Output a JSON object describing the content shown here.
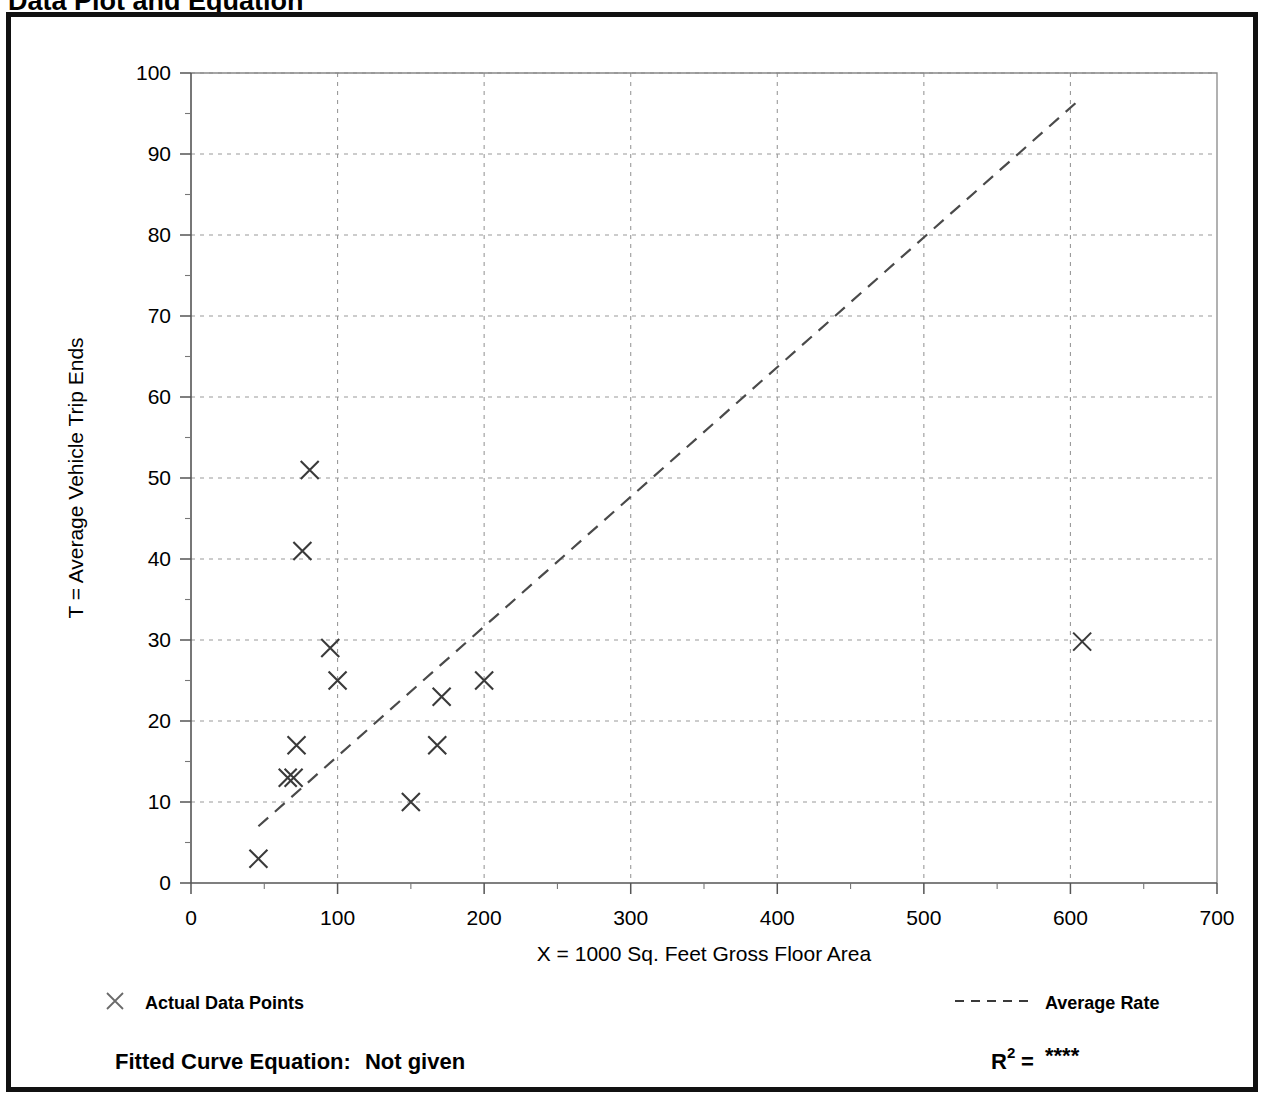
{
  "page": {
    "title": "Data Plot and Equation"
  },
  "chart_data": {
    "type": "scatter",
    "title": "Data Plot and Equation",
    "xlabel": "X = 1000 Sq. Feet Gross Floor Area",
    "ylabel": "T = Average Vehicle Trip Ends",
    "xlim": [
      0,
      700
    ],
    "ylim": [
      0,
      100
    ],
    "xticks": [
      0,
      100,
      200,
      300,
      400,
      500,
      600,
      700
    ],
    "yticks": [
      0,
      10,
      20,
      30,
      40,
      50,
      60,
      70,
      80,
      90,
      100
    ],
    "xtick_labels": [
      "0",
      "100",
      "200",
      "300",
      "400",
      "500",
      "600",
      "700"
    ],
    "ytick_labels": [
      "0",
      "10",
      "20",
      "30",
      "40",
      "50",
      "60",
      "70",
      "80",
      "90",
      "100"
    ],
    "x_minor_step": 50,
    "y_minor_step": 5,
    "grid": true,
    "grid_style": "dotted",
    "legend_position": "below-plot",
    "series": [
      {
        "name": "Actual Data Points",
        "type": "scatter",
        "marker": "x",
        "points": [
          [
            46,
            3
          ],
          [
            66,
            13
          ],
          [
            70,
            13
          ],
          [
            72,
            17
          ],
          [
            76,
            41
          ],
          [
            81,
            51
          ],
          [
            95,
            29
          ],
          [
            100,
            25
          ],
          [
            150,
            10
          ],
          [
            168,
            17
          ],
          [
            171,
            23
          ],
          [
            200,
            25
          ],
          [
            608,
            29.8
          ]
        ]
      },
      {
        "name": "Average Rate",
        "type": "line",
        "style": "dashed",
        "points": [
          [
            46,
            7
          ],
          [
            608,
            97
          ]
        ]
      }
    ]
  },
  "legend": {
    "data_points_label": "Actual Data Points",
    "average_rate_label": "Average Rate",
    "data_points_marker": "x-marker-icon",
    "average_rate_marker": "dashed-line-icon"
  },
  "footer": {
    "equation_label": "Fitted Curve Equation:",
    "equation_value": "Not given",
    "r_squared_base": "R",
    "r_squared_exponent": "2",
    "r_squared_equals": "=",
    "r_squared_value": "****"
  },
  "colors": {
    "frame": "#111111",
    "axis": "#555555",
    "grid": "#9a9a9a",
    "marker": "#3a3a3a",
    "fit_line": "#4a4a4a",
    "text": "#000000",
    "background": "#ffffff"
  }
}
